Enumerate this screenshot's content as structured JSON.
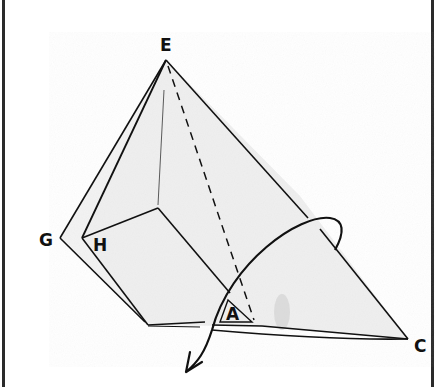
{
  "diagram": {
    "type": "origami-fold-step",
    "labels": {
      "E": "E",
      "G": "G",
      "H": "H",
      "A": "A",
      "C": "C"
    },
    "colors": {
      "line": "#111111",
      "paper": "#f2f2f2",
      "paper_shade": "#e6e6e6",
      "border": "#2a2a2a"
    },
    "annotations": {
      "dashed_line": "valley fold line from E toward A",
      "arrow": "turn-over / fold-behind arrow curving around the right flap"
    }
  }
}
